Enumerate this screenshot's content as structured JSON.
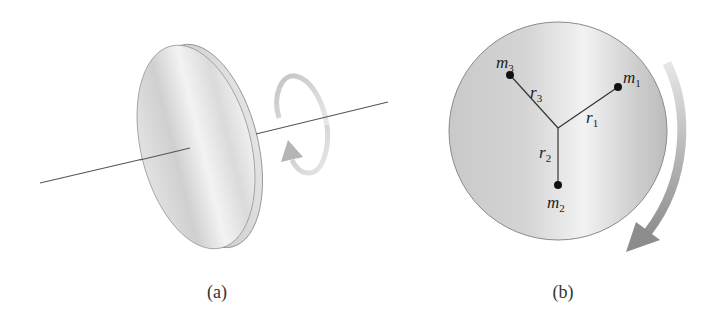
{
  "figure": {
    "panels": [
      {
        "id": "a",
        "caption": "(a)",
        "description": "Disk rotating about a horizontal axis through its center",
        "elements": [
          "disk",
          "rotation-axis",
          "circular-rotation-arrow"
        ]
      },
      {
        "id": "b",
        "caption": "(b)",
        "description": "Face-on view of disk with three point masses at radii from center",
        "masses": [
          {
            "name": "m",
            "sub": "1",
            "radius_label": "r",
            "radius_sub": "1"
          },
          {
            "name": "m",
            "sub": "2",
            "radius_label": "r",
            "radius_sub": "2"
          },
          {
            "name": "m",
            "sub": "3",
            "radius_label": "r",
            "radius_sub": "3"
          }
        ],
        "rotation_direction": "clockwise"
      }
    ],
    "colors": {
      "disk_face": "#d9d9d9",
      "disk_highlight": "#f4f4f4",
      "disk_edge": "#8a8a8a",
      "rim": "#c8c8c8",
      "axis_line": "#555555",
      "arrow": "#a8a8a8",
      "mass_dot": "#111111",
      "radius_line": "#333333"
    }
  }
}
